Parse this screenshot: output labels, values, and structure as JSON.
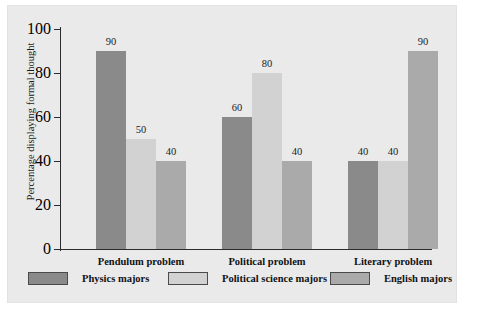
{
  "chart_data": {
    "type": "bar",
    "title": "",
    "xlabel": "",
    "ylabel": "Percentage displaying formal thought",
    "ylim": [
      0,
      100
    ],
    "yticks": [
      "0",
      "20",
      "40",
      "60",
      "80",
      "100"
    ],
    "ytick_values": [
      0,
      20,
      40,
      60,
      80,
      100
    ],
    "grid": false,
    "legend_position": "bottom",
    "categories": [
      "Pendulum problem",
      "Political problem",
      "Literary problem"
    ],
    "series": [
      {
        "name": "Physics majors",
        "color": "#8a8a8a",
        "values": [
          90,
          60,
          40
        ],
        "labels": [
          "90",
          "60",
          "40"
        ]
      },
      {
        "name": "Political science majors",
        "color": "#d2d2d2",
        "values": [
          50,
          80,
          40
        ],
        "labels": [
          "50",
          "80",
          "40"
        ]
      },
      {
        "name": "English majors",
        "color": "#aaaaaa",
        "values": [
          40,
          40,
          90
        ],
        "labels": [
          "40",
          "40",
          "90"
        ]
      }
    ]
  },
  "figure": {
    "panel_background": "#eaeaea",
    "page_background": "#ffffff",
    "axis_color": "#2b2b2b"
  }
}
